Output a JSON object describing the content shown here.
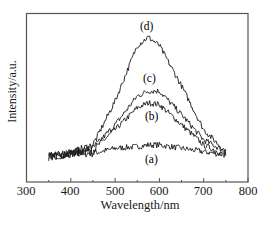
{
  "chart_data": {
    "type": "line",
    "title": "",
    "xlabel": "Wavelength/nm",
    "ylabel": "Intensity/a.u.",
    "xlim": [
      300,
      800
    ],
    "ylim": [
      0,
      100
    ],
    "xticks": [
      300,
      400,
      500,
      600,
      700,
      800
    ],
    "yticks": [],
    "grid": false,
    "legend": "inline labels",
    "x": [
      350,
      400,
      450,
      500,
      550,
      575,
      600,
      650,
      700,
      750
    ],
    "series": [
      {
        "name": "(a)",
        "values": [
          15,
          17,
          17,
          20,
          21,
          22,
          22,
          20,
          18,
          16
        ]
      },
      {
        "name": "(b)",
        "values": [
          15,
          17,
          19,
          31,
          44,
          47,
          46,
          34,
          22,
          16
        ]
      },
      {
        "name": "(c)",
        "values": [
          15,
          17,
          20,
          34,
          51,
          54,
          54,
          40,
          25,
          18
        ]
      },
      {
        "name": "(d)",
        "values": [
          15,
          17,
          22,
          48,
          81,
          86,
          81,
          57,
          31,
          18
        ]
      }
    ],
    "annotations": [
      {
        "text": "(a)",
        "x": 590,
        "y": 10
      },
      {
        "text": "(b)",
        "x": 590,
        "y": 38
      },
      {
        "text": "(c)",
        "x": 580,
        "y": 61
      },
      {
        "text": "(d)",
        "x": 575,
        "y": 92
      }
    ]
  },
  "labels": {
    "xlabel": "Wavelength/nm",
    "ylabel": "Intensity/a.u.",
    "ticks": [
      "300",
      "400",
      "500",
      "600",
      "700",
      "800"
    ],
    "curve_a": "(a)",
    "curve_b": "(b)",
    "curve_c": "(c)",
    "curve_d": "(d)"
  }
}
